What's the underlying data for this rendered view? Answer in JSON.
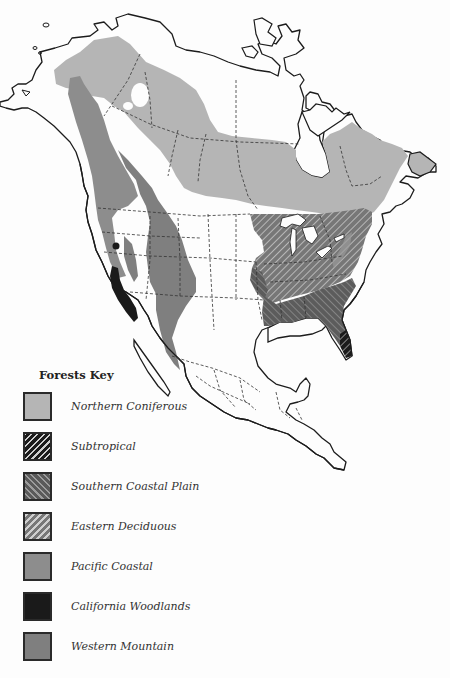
{
  "page": {
    "title_fragment": "",
    "map_subject": "North American Forests"
  },
  "key": {
    "title": "Forests Key",
    "items": [
      {
        "id": "northern-coniferous",
        "label": "Northern Coniferous",
        "fill": "#b5b5b5",
        "pattern": "solid"
      },
      {
        "id": "subtropical",
        "label": "Subtropical",
        "fill": "#1e1e1e",
        "pattern": "hatch-light-forward"
      },
      {
        "id": "southern-coastal-plain",
        "label": "Southern Coastal Plain",
        "fill": "#5a5a5a",
        "pattern": "hatch-dark-back"
      },
      {
        "id": "eastern-deciduous",
        "label": "Eastern Deciduous",
        "fill": "#777777",
        "pattern": "hatch-light-forward"
      },
      {
        "id": "pacific-coastal",
        "label": "Pacific Coastal",
        "fill": "#8d8d8d",
        "pattern": "solid"
      },
      {
        "id": "california-woodlands",
        "label": "California Woodlands",
        "fill": "#1a1a1a",
        "pattern": "solid"
      },
      {
        "id": "western-mountain",
        "label": "Western Mountain",
        "fill": "#7f7f7f",
        "pattern": "solid"
      }
    ]
  },
  "colors": {
    "background": "#fdfdfd",
    "outline": "#1c1c1c",
    "border_dashed": "#333333"
  }
}
